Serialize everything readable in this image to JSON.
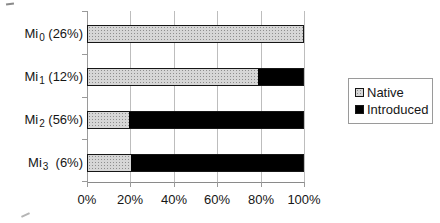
{
  "chart_data": {
    "type": "bar",
    "orientation": "horizontal",
    "stacked": true,
    "title": "",
    "xlabel": "",
    "ylabel": "",
    "xlim": [
      0,
      100
    ],
    "grid": true,
    "legend_position": "right",
    "x_ticks": [
      "0%",
      "20%",
      "40%",
      "60%",
      "80%",
      "100%"
    ],
    "categories": [
      {
        "prefix": "Mi",
        "sub": "0",
        "share": " (26%)"
      },
      {
        "prefix": "Mi",
        "sub": "1",
        "share": " (12%)"
      },
      {
        "prefix": "Mi",
        "sub": "2",
        "share": " (56%)"
      },
      {
        "prefix": "Mi",
        "sub": "3",
        "share": "  (6%)"
      }
    ],
    "series": [
      {
        "name": "Native",
        "color": "#d6d6d6",
        "pattern": "speckled",
        "values": [
          100,
          79,
          19,
          20
        ]
      },
      {
        "name": "Introduced",
        "color": "#000000",
        "pattern": "solid",
        "values": [
          0,
          21,
          81,
          80
        ]
      }
    ]
  }
}
